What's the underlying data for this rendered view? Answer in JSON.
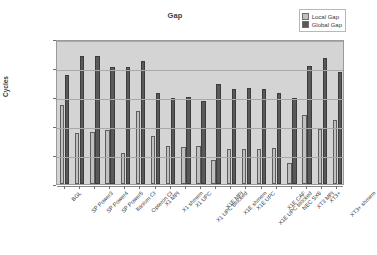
{
  "chart_data": {
    "type": "bar",
    "title": "Gap",
    "xlabel": "",
    "ylabel": "Cycles",
    "yscale": "log",
    "ylim": [
      0.01,
      1000
    ],
    "grid": true,
    "legend_position": "top-right",
    "ytick_labels": [
      "1,000.0",
      "100.0",
      "10.0",
      "1.0",
      "0.1",
      "0.0"
    ],
    "ytick_values": [
      1000,
      100,
      10,
      1,
      0.1,
      0.01
    ],
    "categories": [
      "BGL",
      "SP Power3",
      "SP Power4",
      "SP Power5",
      "Itanium CI",
      "Opteron CI",
      "X1 MPI",
      "X1 shmem",
      "X1 UPC",
      "X1 UPC blocked",
      "X1E MPI",
      "X1E shmem",
      "X1E UPC",
      "X1E UPC blocked",
      "X1E CAF",
      "NEC SX6",
      "XT3 MPI",
      "XT3+",
      "XT3+ shmem"
    ],
    "series": [
      {
        "name": "Local Gap",
        "color": "#c0c0c0",
        "values": [
          5.5,
          0.57,
          0.6,
          0.73,
          0.12,
          3.4,
          0.44,
          0.2,
          0.19,
          0.2,
          0.065,
          0.155,
          0.155,
          0.155,
          0.175,
          0.054,
          2.4,
          0.82,
          1.6
        ]
      },
      {
        "name": "Global Gap",
        "color": "#595959",
        "values": [
          57,
          260,
          255,
          110,
          105,
          180,
          13.5,
          9.3,
          10,
          7.2,
          28,
          19,
          21,
          19,
          14,
          9.0,
          115,
          230,
          72
        ]
      }
    ]
  },
  "legend": {
    "items": [
      {
        "label": "Local Gap",
        "color": "#c0c0c0"
      },
      {
        "label": "Global Gap",
        "color": "#595959"
      }
    ]
  }
}
